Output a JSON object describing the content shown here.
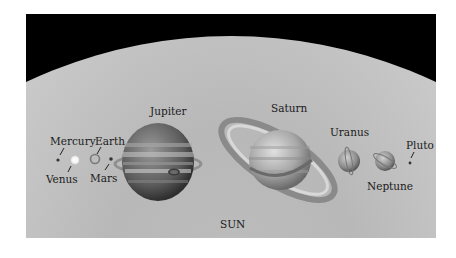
{
  "background": {
    "space_color": "#000000",
    "sun_color": "#c8c8c8"
  },
  "labels": {
    "sun": "SUN",
    "mercury": "Mercury",
    "venus": "Venus",
    "earth": "Earth",
    "mars": "Mars",
    "jupiter": "Jupiter",
    "saturn": "Saturn",
    "uranus": "Uranus",
    "neptune": "Neptune",
    "pluto": "Pluto"
  },
  "planets": [
    "Mercury",
    "Venus",
    "Earth",
    "Mars",
    "Jupiter",
    "Saturn",
    "Uranus",
    "Neptune",
    "Pluto"
  ]
}
